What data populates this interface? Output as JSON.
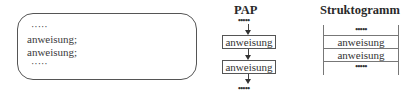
{
  "code": {
    "lines": [
      "·····",
      "anweisung;",
      "anweisung;",
      "·····"
    ]
  },
  "pap": {
    "title": "PAP",
    "top_dots": "•••••",
    "boxes": [
      "anweisung",
      "anweisung"
    ],
    "bottom_dots": "•••••"
  },
  "struktogramm": {
    "title": "Struktogramm",
    "rows": [
      "•••••",
      "anweisung",
      "anweisung",
      "•••••"
    ]
  }
}
